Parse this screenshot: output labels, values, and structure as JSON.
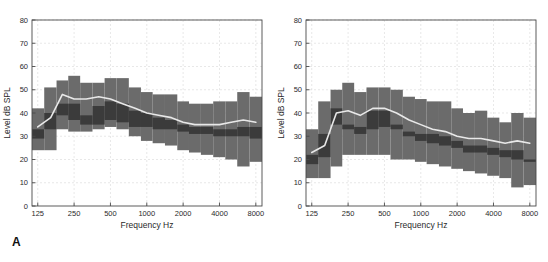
{
  "figure": {
    "background": "#ffffff",
    "panel_labels": [
      {
        "name": "panel-label-a",
        "text": "A"
      },
      {
        "name": "panel-label-b",
        "text": "B"
      }
    ]
  },
  "colors": {
    "outer_band": "#6b6b6b",
    "inner_band": "#3b3b3b",
    "median_line": "#e8e8e8",
    "axis": "#4a4a4a",
    "grid": "#d9d9d9",
    "text": "#2a2a2a"
  },
  "chart_data": [
    {
      "id": "panel-a",
      "type": "bar",
      "title": "",
      "xlabel": "Frequency Hz",
      "ylabel": "Level dB SPL",
      "xscale": "log",
      "xlim": [
        112,
        9000
      ],
      "ylim": [
        0,
        80
      ],
      "ytick_step": 10,
      "yticks": [
        0,
        10,
        20,
        30,
        40,
        50,
        60,
        70,
        80
      ],
      "xticks": [
        125,
        250,
        500,
        1000,
        2000,
        4000,
        8000
      ],
      "xtick_labels": [
        "125",
        "250",
        "500",
        "1000",
        "2000",
        "4000",
        "8000"
      ],
      "grid": true,
      "legend": "none",
      "band_center_frequencies": [
        125,
        160,
        200,
        250,
        315,
        400,
        500,
        630,
        800,
        1000,
        1250,
        1600,
        2000,
        2500,
        3150,
        4000,
        5000,
        6300,
        8000
      ],
      "series": [
        {
          "name": "outer_band_upper",
          "values": [
            42,
            51,
            54,
            56,
            53,
            53,
            55,
            55,
            51,
            49,
            48,
            48,
            45,
            44,
            44,
            45,
            45,
            49,
            47
          ]
        },
        {
          "name": "inner_band_upper",
          "values": [
            33,
            40,
            44,
            44,
            39,
            43,
            45,
            44,
            41,
            40,
            38,
            37,
            35,
            34,
            34,
            33,
            33,
            34,
            34
          ]
        },
        {
          "name": "median",
          "values": [
            34,
            38,
            48,
            46,
            46,
            47,
            46,
            44,
            42,
            40,
            39,
            38,
            36,
            35,
            35,
            35,
            36,
            37,
            36
          ]
        },
        {
          "name": "inner_band_lower",
          "values": [
            29,
            33,
            39,
            37,
            35,
            35,
            37,
            36,
            34,
            34,
            33,
            33,
            32,
            31,
            31,
            30,
            30,
            30,
            29
          ]
        },
        {
          "name": "outer_band_lower",
          "values": [
            24,
            24,
            33,
            32,
            32,
            33,
            34,
            33,
            30,
            28,
            27,
            26,
            24,
            23,
            22,
            21,
            20,
            17,
            19
          ]
        }
      ]
    },
    {
      "id": "panel-b",
      "type": "bar",
      "title": "",
      "xlabel": "Frequency Hz",
      "ylabel": "Level dB SPL",
      "xscale": "log",
      "xlim": [
        112,
        9000
      ],
      "ylim": [
        0,
        80
      ],
      "ytick_step": 10,
      "yticks": [
        0,
        10,
        20,
        30,
        40,
        50,
        60,
        70,
        80
      ],
      "xticks": [
        125,
        250,
        500,
        1000,
        2000,
        4000,
        8000
      ],
      "xtick_labels": [
        "125",
        "250",
        "500",
        "1000",
        "2000",
        "4000",
        "8000"
      ],
      "grid": true,
      "legend": "none",
      "band_center_frequencies": [
        125,
        160,
        200,
        250,
        315,
        400,
        500,
        630,
        800,
        1000,
        1250,
        1600,
        2000,
        2500,
        3150,
        4000,
        5000,
        6300,
        8000
      ],
      "series": [
        {
          "name": "outer_band_upper",
          "values": [
            33,
            45,
            50,
            53,
            49,
            51,
            51,
            50,
            47,
            46,
            45,
            45,
            42,
            40,
            41,
            38,
            36,
            40,
            38
          ]
        },
        {
          "name": "inner_band_upper",
          "values": [
            22,
            31,
            42,
            35,
            34,
            41,
            41,
            35,
            32,
            31,
            31,
            30,
            28,
            26,
            26,
            25,
            24,
            24,
            20
          ]
        },
        {
          "name": "median",
          "values": [
            23,
            26,
            40,
            41,
            39,
            42,
            42,
            40,
            37,
            35,
            33,
            32,
            30,
            29,
            29,
            28,
            27,
            28,
            27
          ]
        },
        {
          "name": "inner_band_lower",
          "values": [
            18,
            21,
            35,
            33,
            31,
            33,
            34,
            33,
            30,
            28,
            27,
            26,
            25,
            23,
            23,
            22,
            21,
            20,
            19
          ]
        },
        {
          "name": "outer_band_lower",
          "values": [
            12,
            12,
            17,
            22,
            22,
            22,
            22,
            20,
            20,
            19,
            18,
            17,
            16,
            15,
            14,
            13,
            12,
            8,
            9
          ]
        }
      ]
    }
  ]
}
